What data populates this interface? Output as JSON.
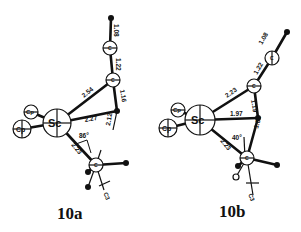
{
  "structures": [
    {
      "id": "10a",
      "label": "10a",
      "metal": "Sc",
      "ligands": [
        "Cp",
        "Cp"
      ],
      "bond_lengths": {
        "H_C1": "1.08",
        "C1_C2": "1.22",
        "C2_C3": "1.16",
        "Sc_C2": "2.54",
        "Sc_C3": "2.27",
        "C3_C4": "2.12",
        "Sc_C4": "2.23"
      },
      "angle": "86°",
      "atom_labels": {
        "c": "C",
        "c3": "C3"
      }
    },
    {
      "id": "10b",
      "label": "10b",
      "metal": "Sc",
      "ligands": [
        "Cp",
        "Cp"
      ],
      "bond_lengths": {
        "H_C1": "1.08",
        "C1_C2": "1.22",
        "C2_C3": "1.19",
        "Sc_C2": "2.23",
        "Sc_C3": "1.97",
        "C3_C4": "1.64",
        "Sc_C4": "2.23"
      },
      "angle": "40°",
      "atom_labels": {
        "c": "C",
        "c3": "C3"
      }
    }
  ]
}
